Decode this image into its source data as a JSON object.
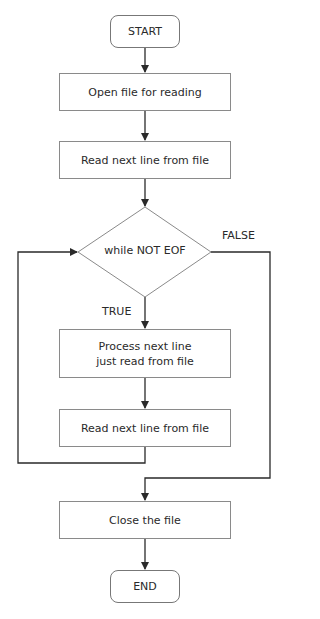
{
  "diagram": {
    "type": "flowchart",
    "nodes": {
      "start": {
        "label": "START",
        "shape": "terminal"
      },
      "open_file": {
        "label": "Open file for reading",
        "shape": "process"
      },
      "read_first": {
        "label": "Read next line from file",
        "shape": "process"
      },
      "loop_condition": {
        "label": "while NOT EOF",
        "shape": "decision"
      },
      "process_line_1": {
        "label": "Process next line",
        "shape": "process"
      },
      "process_line_2": {
        "label": "just read from file",
        "shape": "process"
      },
      "read_next": {
        "label": "Read next line from file",
        "shape": "process"
      },
      "close_file": {
        "label": "Close the file",
        "shape": "process"
      },
      "end": {
        "label": "END",
        "shape": "terminal"
      }
    },
    "edge_labels": {
      "true": "TRUE",
      "false": "FALSE"
    },
    "edges": [
      {
        "from": "start",
        "to": "open_file"
      },
      {
        "from": "open_file",
        "to": "read_first"
      },
      {
        "from": "read_first",
        "to": "loop_condition"
      },
      {
        "from": "loop_condition",
        "to": "process_line",
        "label": "TRUE"
      },
      {
        "from": "process_line",
        "to": "read_next"
      },
      {
        "from": "read_next",
        "to": "loop_condition"
      },
      {
        "from": "loop_condition",
        "to": "close_file",
        "label": "FALSE"
      },
      {
        "from": "close_file",
        "to": "end"
      }
    ],
    "colors": {
      "stroke": "#8a8a8a",
      "arrow": "#2a2a2a",
      "text": "#2a2a2a"
    }
  }
}
